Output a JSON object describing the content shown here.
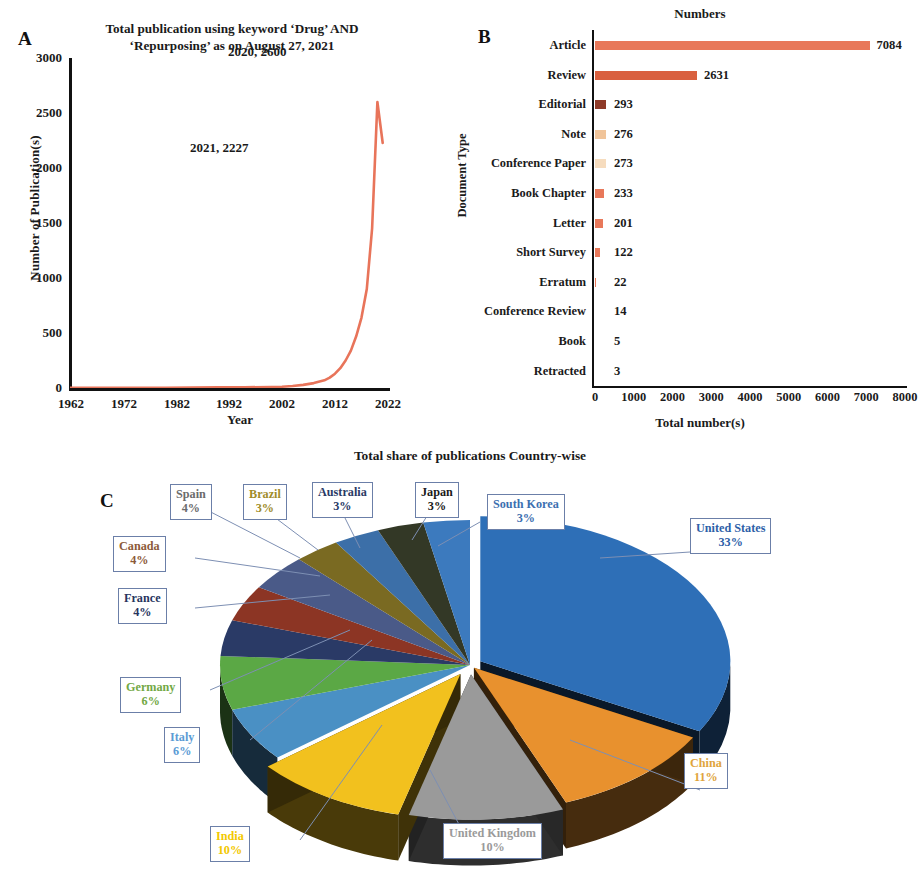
{
  "figure": {
    "panels": [
      "A",
      "B",
      "C"
    ]
  },
  "panelA": {
    "letter": "A",
    "title": "Total publication using keyword ‘Drug’ AND ‘Repurposing’ as on August 27, 2021",
    "title_line1": "Total publication using keyword ‘Drug’ AND",
    "title_line2": "‘Repurposing’ as on August 27, 2021",
    "ylabel": "Number of Publication(s)",
    "xlabel": "Year",
    "yticks": [
      "3000",
      "2500",
      "2000",
      "1500",
      "1000",
      "500",
      "0"
    ],
    "xticks": [
      "1962",
      "1972",
      "1982",
      "1992",
      "2002",
      "2012",
      "2022"
    ],
    "annotation_peak": "2020, 2600",
    "annotation_last": "2021, 2227",
    "line_color": "#E8745A"
  },
  "panelB": {
    "letter": "B",
    "title": "Numbers",
    "ylabel": "Document Type",
    "xlabel": "Total number(s)",
    "xticks": [
      "0",
      "1000",
      "2000",
      "3000",
      "4000",
      "5000",
      "6000",
      "7000",
      "8000"
    ],
    "rows": [
      {
        "label": "Article",
        "value": "7084",
        "n": 7084,
        "color": "#E8785A"
      },
      {
        "label": "Review",
        "value": "2631",
        "n": 2631,
        "color": "#D9603F"
      },
      {
        "label": "Editorial",
        "value": "293",
        "n": 293,
        "color": "#8E3A28"
      },
      {
        "label": "Note",
        "value": "276",
        "n": 276,
        "color": "#F0C49A"
      },
      {
        "label": "Conference Paper",
        "value": "273",
        "n": 273,
        "color": "#F6DCBE"
      },
      {
        "label": "Book Chapter",
        "value": "233",
        "n": 233,
        "color": "#E8785A"
      },
      {
        "label": "Letter",
        "value": "201",
        "n": 201,
        "color": "#E8785A"
      },
      {
        "label": "Short Survey",
        "value": "122",
        "n": 122,
        "color": "#E8785A"
      },
      {
        "label": "Erratum",
        "value": "22",
        "n": 22,
        "color": "#E8785A"
      },
      {
        "label": "Conference Review",
        "value": "14",
        "n": 14,
        "color": "#E8785A"
      },
      {
        "label": "Book",
        "value": "5",
        "n": 5,
        "color": "#E8785A"
      },
      {
        "label": "Retracted",
        "value": "3",
        "n": 3,
        "color": "#E8785A"
      }
    ]
  },
  "panelC": {
    "letter": "C",
    "title": "Total share of publications Country-wise",
    "slices": [
      {
        "label": "United States",
        "pct": "33%",
        "value": 33,
        "color": "#2E6FB7",
        "label_color": "#2E5FA8"
      },
      {
        "label": "China",
        "pct": "11%",
        "value": 11,
        "color": "#E8912E",
        "label_color": "#E0A43C"
      },
      {
        "label": "United Kingdom",
        "pct": "10%",
        "value": 10,
        "color": "#9A9A9A",
        "label_color": "#9A9A9A"
      },
      {
        "label": "India",
        "pct": "10%",
        "value": 10,
        "color": "#F2C11E",
        "label_color": "#F2C800"
      },
      {
        "label": "Italy",
        "pct": "6%",
        "value": 6,
        "color": "#4A90C4",
        "label_color": "#5B9BD5"
      },
      {
        "label": "Germany",
        "pct": "6%",
        "value": 6,
        "color": "#5BA845",
        "label_color": "#72A844"
      },
      {
        "label": "France",
        "pct": "4%",
        "value": 4,
        "color": "#2A3A66",
        "label_color": "#27355E"
      },
      {
        "label": "Canada",
        "pct": "4%",
        "value": 4,
        "color": "#8C3524",
        "label_color": "#8C5A38"
      },
      {
        "label": "Spain",
        "pct": "4%",
        "value": 4,
        "color": "#4A5A88",
        "label_color": "#6B6B6B"
      },
      {
        "label": "Brazil",
        "pct": "3%",
        "value": 3,
        "color": "#7A6A22",
        "label_color": "#A08C2A"
      },
      {
        "label": "Australia",
        "pct": "3%",
        "value": 3,
        "color": "#3C6FA8",
        "label_color": "#2A3A66"
      },
      {
        "label": "Japan",
        "pct": "3%",
        "value": 3,
        "color": "#333826",
        "label_color": "#1A1A1A"
      },
      {
        "label": "South Korea",
        "pct": "3%",
        "value": 3,
        "color": "#3C7ABE",
        "label_color": "#3C6FB0"
      }
    ]
  },
  "chart_data": [
    {
      "type": "line",
      "panel": "A",
      "title": "Total publication using keyword 'Drug' AND 'Repurposing' as on August 27, 2021",
      "xlabel": "Year",
      "ylabel": "Number of Publication(s)",
      "xlim": [
        1962,
        2022
      ],
      "ylim": [
        0,
        3000
      ],
      "xticks": [
        1962,
        1972,
        1982,
        1992,
        2002,
        2012,
        2022
      ],
      "yticks": [
        0,
        500,
        1000,
        1500,
        2000,
        2500,
        3000
      ],
      "grid": false,
      "legend": "none",
      "series": [
        {
          "name": "Publications per year",
          "color": "#E8745A",
          "x": [
            1962,
            1965,
            1970,
            1975,
            1980,
            1985,
            1990,
            1995,
            2000,
            2002,
            2004,
            2006,
            2008,
            2010,
            2011,
            2012,
            2013,
            2014,
            2015,
            2016,
            2017,
            2018,
            2019,
            2020,
            2021
          ],
          "values": [
            1,
            1,
            2,
            2,
            3,
            4,
            5,
            6,
            9,
            12,
            18,
            28,
            45,
            70,
            95,
            130,
            180,
            250,
            340,
            470,
            640,
            900,
            1450,
            2600,
            2227
          ]
        }
      ],
      "annotations": [
        {
          "text": "2020, 2600",
          "x": 2020,
          "y": 2600
        },
        {
          "text": "2021, 2227",
          "x": 2021,
          "y": 2227
        }
      ]
    },
    {
      "type": "bar",
      "panel": "B",
      "orientation": "horizontal",
      "title": "Numbers",
      "xlabel": "Total number(s)",
      "ylabel": "Document Type",
      "xlim": [
        0,
        8000
      ],
      "xticks": [
        0,
        1000,
        2000,
        3000,
        4000,
        5000,
        6000,
        7000,
        8000
      ],
      "grid": false,
      "legend": "none",
      "categories": [
        "Article",
        "Review",
        "Editorial",
        "Note",
        "Conference Paper",
        "Book Chapter",
        "Letter",
        "Short Survey",
        "Erratum",
        "Conference Review",
        "Book",
        "Retracted"
      ],
      "values": [
        7084,
        2631,
        293,
        276,
        273,
        233,
        201,
        122,
        22,
        14,
        5,
        3
      ]
    },
    {
      "type": "pie",
      "panel": "C",
      "title": "Total share of publications Country-wise",
      "style": "3d-exploded",
      "unit": "percent",
      "legend": "callout-labels",
      "categories": [
        "United States",
        "China",
        "United Kingdom",
        "India",
        "Italy",
        "Germany",
        "France",
        "Canada",
        "Spain",
        "Brazil",
        "Australia",
        "Japan",
        "South Korea"
      ],
      "values": [
        33,
        11,
        10,
        10,
        6,
        6,
        4,
        4,
        4,
        3,
        3,
        3,
        3
      ]
    }
  ]
}
